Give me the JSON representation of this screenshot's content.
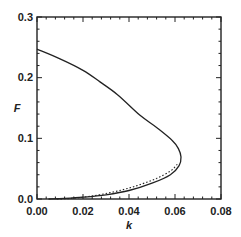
{
  "chart_data": {
    "type": "line",
    "title": "",
    "xlabel": "k",
    "ylabel": "F",
    "xlim": [
      0.0,
      0.08
    ],
    "ylim": [
      0.0,
      0.3
    ],
    "xticks": [
      "0.00",
      "0.02",
      "0.04",
      "0.06",
      "0.08"
    ],
    "yticks": [
      "0.0",
      "0.1",
      "0.2",
      "0.3"
    ],
    "grid": false,
    "legend": null,
    "series": [
      {
        "name": "solid",
        "style": "solid",
        "x": [
          0.0,
          0.01,
          0.02,
          0.0274,
          0.035,
          0.0448,
          0.052,
          0.0587,
          0.0615,
          0.0626,
          0.0618,
          0.058,
          0.05,
          0.04,
          0.03,
          0.02,
          0.012,
          0.005
        ],
        "y": [
          0.247,
          0.231,
          0.212,
          0.193,
          0.172,
          0.138,
          0.118,
          0.097,
          0.083,
          0.069,
          0.055,
          0.04,
          0.026,
          0.014,
          0.007,
          0.003,
          0.001,
          0.0
        ]
      },
      {
        "name": "dotted",
        "style": "dotted",
        "x": [
          0.061,
          0.058,
          0.052,
          0.045,
          0.038,
          0.03,
          0.022,
          0.015,
          0.008
        ],
        "y": [
          0.057,
          0.046,
          0.034,
          0.024,
          0.016,
          0.009,
          0.004,
          0.001,
          0.0
        ]
      }
    ]
  },
  "labels": {
    "xlabel": "k",
    "ylabel": "F",
    "xticks": [
      "0.00",
      "0.02",
      "0.04",
      "0.06",
      "0.08"
    ],
    "yticks": [
      "0.0",
      "0.1",
      "0.2",
      "0.3"
    ]
  }
}
